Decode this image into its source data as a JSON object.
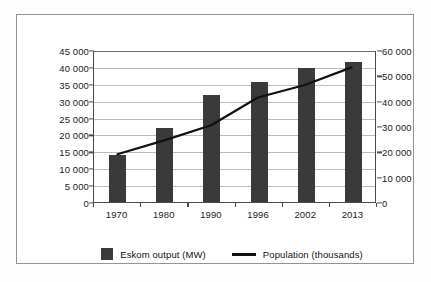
{
  "chart_data": {
    "type": "bar",
    "title": "",
    "subtitle": "",
    "xlabel": "",
    "ylabel": "",
    "categories": [
      "1970",
      "1980",
      "1990",
      "1996",
      "2002",
      "2013"
    ],
    "series": [
      {
        "name": "Eskom output (MW)",
        "type": "bar",
        "axis": "left",
        "values": [
          13800,
          21800,
          31600,
          35600,
          39800,
          41500
        ]
      },
      {
        "name": "Population (thousands)",
        "type": "line",
        "axis": "right",
        "values": [
          19000,
          24500,
          30500,
          41500,
          46500,
          53500
        ]
      }
    ],
    "left_axis": {
      "ticks": [
        "0",
        "5 000",
        "10 000",
        "15 000",
        "20 000",
        "25 000",
        "30 000",
        "35 000",
        "40 000",
        "45 000"
      ],
      "tick_values": [
        0,
        5000,
        10000,
        15000,
        20000,
        25000,
        30000,
        35000,
        40000,
        45000
      ],
      "ylim": [
        0,
        45000
      ]
    },
    "right_axis": {
      "ticks": [
        "0",
        "10 000",
        "20 000",
        "30 000",
        "40 000",
        "50 000",
        "60 000"
      ],
      "tick_values": [
        0,
        10000,
        20000,
        30000,
        40000,
        50000,
        60000
      ],
      "ylim": [
        0,
        60000
      ]
    },
    "grid": true,
    "legend_position": "bottom",
    "colors": {
      "bar": "#3a3a3a",
      "line": "#111111",
      "grid": "#b9bcbf",
      "axis": "#4a4a4a",
      "frame": "#8f9296",
      "background": "#ffffff"
    }
  },
  "legend": {
    "entries": [
      {
        "label": "Eskom output (MW)",
        "marker": "bar-swatch"
      },
      {
        "label": "Population (thousands)",
        "marker": "line-swatch"
      }
    ]
  }
}
